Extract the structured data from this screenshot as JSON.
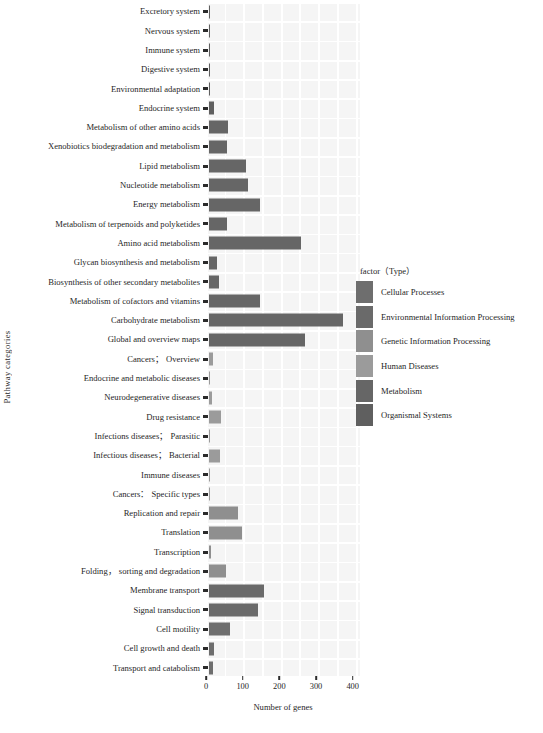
{
  "chart_data": {
    "type": "bar",
    "orientation": "horizontal",
    "title": "",
    "xlabel": "Number of genes",
    "ylabel": "Pathway categories",
    "xlim": [
      0,
      420
    ],
    "xticks": [
      0,
      100,
      200,
      300,
      400
    ],
    "xticklabels": [
      "0",
      "100",
      "200",
      "300",
      "400"
    ],
    "grid": true,
    "legend_position": "right",
    "legend_title": "factor（Type）",
    "legend": [
      {
        "label": "Cellular Processes",
        "color": "#6e6e6e"
      },
      {
        "label": "Environmental Information Processing",
        "color": "#6a6a6a"
      },
      {
        "label": "Genetic Information Processing",
        "color": "#8f8f8f"
      },
      {
        "label": "Human Diseases",
        "color": "#9b9b9b"
      },
      {
        "label": "Metabolism",
        "color": "#666666"
      },
      {
        "label": "Organismal Systems",
        "color": "#5f5f5f"
      }
    ],
    "categories": [
      "Excretory system",
      "Nervous system",
      "Immune system",
      "Digestive system",
      "Environmental adaptation",
      "Endocrine system",
      "Metabolism of other amino acids",
      "Xenobiotics biodegradation and metabolism",
      "Lipid metabolism",
      "Nucleotide metabolism",
      "Energy metabolism",
      "Metabolism of terpenoids and polyketides",
      "Amino acid metabolism",
      "Glycan biosynthesis and metabolism",
      "Biosynthesis of other secondary metabolites",
      "Metabolism of cofactors and vitamins",
      "Carbohydrate metabolism",
      "Global and overview maps",
      "Cancers； Overview",
      "Endocrine and metabolic diseases",
      "Neurodegenerative diseases",
      "Drug resistance",
      "Infections diseases； Parasitic",
      "Infectious diseases； Bacterial",
      "Immune diseases",
      "Cancers： Specific types",
      "Replication and repair",
      "Translation",
      "Transcription",
      "Folding， sorting and degradation",
      "Membrane transport",
      "Signal transduction",
      "Cell motility",
      "Cell growth and death",
      "Transport and catabolism"
    ],
    "values": [
      2,
      4,
      3,
      1,
      2,
      13,
      53,
      50,
      100,
      105,
      138,
      50,
      250,
      22,
      28,
      140,
      365,
      262,
      12,
      1,
      8,
      32,
      2,
      29,
      1,
      1,
      78,
      91,
      5,
      45,
      150,
      134,
      56,
      13,
      11
    ],
    "series_group": [
      "Organismal Systems",
      "Organismal Systems",
      "Organismal Systems",
      "Organismal Systems",
      "Organismal Systems",
      "Organismal Systems",
      "Metabolism",
      "Metabolism",
      "Metabolism",
      "Metabolism",
      "Metabolism",
      "Metabolism",
      "Metabolism",
      "Metabolism",
      "Metabolism",
      "Metabolism",
      "Metabolism",
      "Metabolism",
      "Human Diseases",
      "Human Diseases",
      "Human Diseases",
      "Human Diseases",
      "Human Diseases",
      "Human Diseases",
      "Human Diseases",
      "Human Diseases",
      "Genetic Information Processing",
      "Genetic Information Processing",
      "Genetic Information Processing",
      "Genetic Information Processing",
      "Environmental Information Processing",
      "Environmental Information Processing",
      "Cellular Processes",
      "Cellular Processes",
      "Cellular Processes"
    ]
  }
}
